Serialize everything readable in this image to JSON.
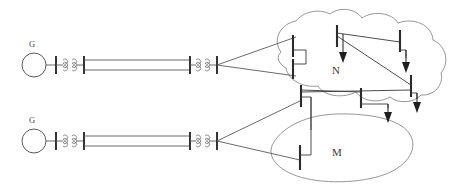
{
  "diagram": {
    "colors": {
      "background": "#ffffff",
      "cloud_outline": "#8a8a8a",
      "line": "#5a5a5a",
      "bus": "#2b2b2b",
      "arrow": "#1f1f1f",
      "text": "#3a3a3a"
    },
    "networks": [
      {
        "id": "N",
        "label": "N",
        "shape": "cloud",
        "x": 336,
        "y": 70
      },
      {
        "id": "M",
        "label": "M",
        "shape": "oval",
        "x": 337,
        "y": 152
      }
    ],
    "generators": [
      {
        "id": "g-top",
        "label": "G",
        "label_x": 32,
        "label_y": 45,
        "cx": 34,
        "cy": 65,
        "r": 12
      },
      {
        "id": "g-bottom",
        "label": "G",
        "label_x": 32,
        "label_y": 121,
        "cx": 34,
        "cy": 141,
        "r": 12
      }
    ],
    "transformers": [
      {
        "id": "xf-top-left",
        "coils": 2,
        "x": 56,
        "y": 65
      },
      {
        "id": "xf-top-right",
        "coils": 2,
        "x": 199,
        "y": 65
      },
      {
        "id": "xf-bottom-left",
        "coils": 2,
        "x": 56,
        "y": 141
      },
      {
        "id": "xf-bottom-right",
        "coils": 2,
        "x": 199,
        "y": 141
      }
    ],
    "transmission_lines": [
      {
        "id": "line-top",
        "style": "double",
        "x1": 84,
        "x2": 190,
        "y": 65
      },
      {
        "id": "line-bottom",
        "style": "double",
        "x1": 84,
        "x2": 190,
        "y": 141
      }
    ],
    "buses": [
      {
        "id": "bus-n-left-upper",
        "network": "N",
        "x": 293,
        "y1": 35,
        "y2": 57
      },
      {
        "id": "bus-n-left-lower",
        "network": "N",
        "x": 293,
        "y1": 59,
        "y2": 79
      },
      {
        "id": "bus-n-top-center",
        "network": "N",
        "x": 337,
        "y1": 25,
        "y2": 47
      },
      {
        "id": "bus-n-top-right",
        "network": "N",
        "x": 400,
        "y1": 30,
        "y2": 52
      },
      {
        "id": "bus-n-right-lower",
        "network": "N",
        "x": 411,
        "y1": 75,
        "y2": 97
      },
      {
        "id": "bus-n-bottom-left",
        "network": "N",
        "x": 301,
        "y1": 85,
        "y2": 107
      },
      {
        "id": "bus-n-bottom-center",
        "network": "N",
        "x": 361,
        "y1": 88,
        "y2": 108
      },
      {
        "id": "bus-m-left",
        "network": "M",
        "x": 300,
        "y1": 145,
        "y2": 170
      }
    ],
    "load_arrows": [
      {
        "id": "load-n-top-center",
        "x": 343,
        "y_top": 47,
        "y_bottom": 62
      },
      {
        "id": "load-n-top-right",
        "x": 406,
        "y_top": 56,
        "y_bottom": 72
      },
      {
        "id": "load-n-right-lower",
        "x": 417,
        "y_top": 96,
        "y_bottom": 112
      },
      {
        "id": "load-n-bottom-center",
        "x": 388,
        "y_top": 105,
        "y_bottom": 122
      }
    ],
    "notes": {
      "line_type": "double parallel transmission line",
      "generator_symbol": "circle with G label",
      "transformer_symbol": "two adjacent coil windings between bus bars"
    }
  }
}
